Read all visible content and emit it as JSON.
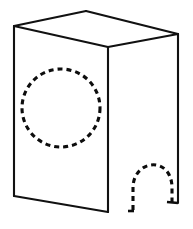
{
  "figure": {
    "object_name": "rectangular-box",
    "view": "isometric-pictorial",
    "line_color": "#111111",
    "hidden_line_color": "#0d0d0d",
    "background_color": "#ffffff",
    "solid_line_width": 2.1,
    "hidden_line_width": 3.1,
    "hidden_dash_pattern": "5 4",
    "geometry": {
      "front_face": {
        "name": "front-face",
        "points": "14,26 108,47 108,212 14,196"
      },
      "top_face": {
        "name": "top-face",
        "points": "14,26 86,11 178,34 108,47"
      },
      "right_face": {
        "name": "right-side-face",
        "points": "108,47 178,34 178,203 108,212"
      },
      "edges": [
        {
          "name": "edge-front-top",
          "d": "M14,26 L108,47"
        },
        {
          "name": "edge-front-left-vertical",
          "d": "M14,26 L14,196"
        },
        {
          "name": "edge-front-bottom",
          "d": "M14,196 L108,212"
        },
        {
          "name": "edge-front-right-vertical",
          "d": "M108,47 L108,212"
        },
        {
          "name": "edge-top-back-left",
          "d": "M14,26 L86,11"
        },
        {
          "name": "edge-top-back-right",
          "d": "M86,11 L178,34"
        },
        {
          "name": "edge-top-right",
          "d": "M178,34 L108,47"
        },
        {
          "name": "edge-back-right-vertical",
          "d": "M178,34 L178,203"
        }
      ],
      "hidden_circle": {
        "name": "hidden-circular-hole",
        "center_x": 61,
        "center_y": 108,
        "radius": 39,
        "squash_y": 1.0
      },
      "hidden_arch": {
        "name": "hidden-arched-cutout",
        "d": "M133,210 L133,188 C133,160 170,155 172,186 L172,203",
        "base_left_tick": "M128,211 L134,211",
        "base_right_tick": "M167,202 L178,203"
      }
    }
  }
}
